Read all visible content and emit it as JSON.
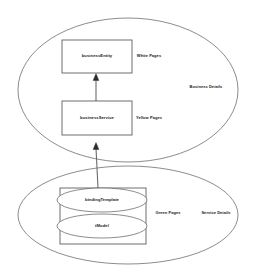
{
  "diagram": {
    "type": "uddi-registry-structure",
    "colors": {
      "stroke": "#5a5a5a",
      "box_stroke": "#4a4a4a",
      "connector": "#6b6b6b",
      "arrow_fill": "#2b2b2b",
      "background": "#ffffff",
      "text": "#1a1a1a"
    },
    "containers": [
      {
        "id": "business-details",
        "shape": "ellipse",
        "label": "Business Details"
      },
      {
        "id": "service-details",
        "shape": "ellipse",
        "label": "Service Details"
      }
    ],
    "nodes": [
      {
        "id": "business-entity",
        "shape": "rectangle",
        "label": "businessEntity",
        "page_label": "White Pages"
      },
      {
        "id": "business-service",
        "shape": "rectangle",
        "label": "businessService",
        "page_label": "Yellow Pages"
      },
      {
        "id": "binding-template",
        "shape": "ellipse",
        "label": "bindingTemplate"
      },
      {
        "id": "tmodel",
        "shape": "ellipse",
        "label": "tModel"
      }
    ],
    "group_labels": [
      {
        "id": "green-pages",
        "label": "Green Pages"
      }
    ],
    "connectors": [
      {
        "id": "service-to-entity",
        "from": "business-service",
        "to": "business-entity",
        "arrow": "filled-triangle",
        "direction": "up"
      },
      {
        "id": "binding-to-service",
        "from": "binding-template",
        "to": "business-service",
        "arrow": "filled-triangle",
        "direction": "up"
      }
    ]
  }
}
